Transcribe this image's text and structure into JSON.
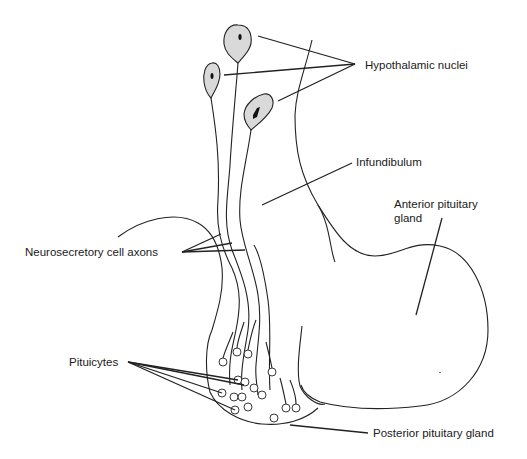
{
  "diagram": {
    "type": "anatomical-line-drawing",
    "labels": {
      "hypothalamic_nuclei": "Hypothalamic nuclei",
      "infundibulum": "Infundibulum",
      "anterior_pituitary_line1": "Anterior pituitary",
      "anterior_pituitary_line2": "gland",
      "neurosecretory_axons": "Neurosecretory cell axons",
      "pituicytes": "Pituicytes",
      "posterior_pituitary": "Posterior pituitary gland"
    },
    "colors": {
      "line": "#222222",
      "cell_fill": "#d9d9d9",
      "background": "#ffffff"
    }
  }
}
